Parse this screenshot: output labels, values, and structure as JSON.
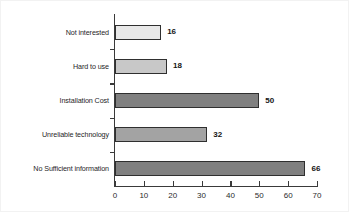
{
  "chart_data": {
    "type": "bar",
    "orientation": "horizontal",
    "title": "",
    "subtitle": "",
    "xlabel": "",
    "ylabel": "",
    "categories": [
      "Not interested",
      "Hard to use",
      "Installation Cost",
      "Unreliable technology",
      "No Sufficient information"
    ],
    "values": [
      16,
      18,
      50,
      32,
      66
    ],
    "value_labels": [
      "16",
      "18",
      "50",
      "32",
      "66"
    ],
    "bar_colors": [
      "#e8e8e8",
      "#c8c8c8",
      "#808080",
      "#a3a3a3",
      "#808080"
    ],
    "bar_edge_color": "#2f2f2f",
    "xlim": [
      0,
      70
    ],
    "xticks": [
      0,
      10,
      20,
      30,
      40,
      50,
      60,
      70
    ],
    "xticklabels": [
      "0",
      "10",
      "20",
      "30",
      "40",
      "50",
      "60",
      "70"
    ],
    "grid": false,
    "legend": null,
    "axis_color": "#3a3a3a",
    "background_color": "#ffffff"
  }
}
